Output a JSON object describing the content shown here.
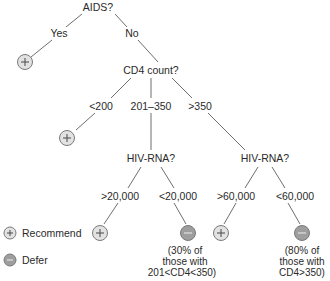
{
  "diagram": {
    "type": "decision-tree",
    "colors": {
      "recommend_fill": "#e2e2e2",
      "defer_fill": "#9e9e9e",
      "edge": "#6e6e6e",
      "text": "#2a2a2a"
    },
    "nodes": {
      "root": "AIDS?",
      "yes": "Yes",
      "no": "No",
      "cd4": "CD4 count?",
      "cd4_low": "<200",
      "cd4_mid": "201–350",
      "cd4_high": ">350",
      "hiv_rna_mid": "HIV-RNA?",
      "hiv_rna_high": "HIV-RNA?",
      "mid_gt": ">20,000",
      "mid_lt": "<20,000",
      "high_gt": ">60,000",
      "high_lt": "<60,000"
    },
    "outcomes": {
      "yes_branch": "recommend",
      "cd4_low": "recommend",
      "mid_gt": "recommend",
      "mid_lt": "defer",
      "high_gt": "recommend",
      "high_lt": "defer"
    },
    "notes": {
      "mid_lt": [
        "(30% of",
        "those with",
        "201<CD4<350)"
      ],
      "high_lt": [
        "(80% of",
        "those with",
        "CD4>350)"
      ]
    },
    "legend": {
      "recommend": "Recommend",
      "defer": "Defer"
    }
  }
}
